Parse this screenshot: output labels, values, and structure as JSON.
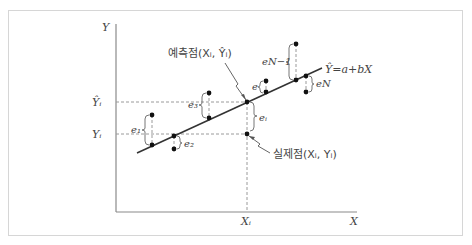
{
  "header": {
    "cut_text": ""
  },
  "diagram": {
    "title": "",
    "axes": {
      "x_label": "X",
      "y_label": "Y"
    },
    "ticks": {
      "x_tick": "Xᵢ",
      "y_hat_tick": "Ŷᵢ",
      "y_tick": "Yᵢ"
    },
    "regression_line": {
      "label": "Ŷ=a+bX"
    },
    "predicted_point": {
      "label": "예측점(Xᵢ, Ŷᵢ)"
    },
    "actual_point": {
      "label": "실제점(Xᵢ, Yᵢ)"
    },
    "residuals": [
      {
        "name": "e1",
        "label": "e₁"
      },
      {
        "name": "e2",
        "label": "e₂"
      },
      {
        "name": "e3",
        "label": "e₃"
      },
      {
        "name": "ei",
        "label": "eᵢ"
      },
      {
        "name": "e",
        "label": "e"
      },
      {
        "name": "eN-1",
        "label": "eN−1"
      },
      {
        "name": "eN",
        "label": "eN"
      }
    ],
    "colors": {
      "axis": "#8a8a8a",
      "line": "#333333",
      "dashed": "#9a9a9a",
      "point": "#111111"
    }
  }
}
